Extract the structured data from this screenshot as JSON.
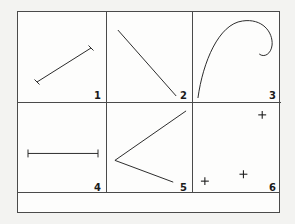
{
  "figure": {
    "background_color": "#f3f3f1",
    "plate_color": "#fdfdfc",
    "border_color": "#4a4a4a",
    "ink_color": "#2b2b2b",
    "caption": "",
    "grid": {
      "columns": 3,
      "rows": 2
    },
    "panels": [
      {
        "number": "1",
        "content": "line-segment-with-end-ticks",
        "description": "diagonal straight line rising left to right with short tick caps at both ends"
      },
      {
        "number": "2",
        "content": "long-diagonal-line",
        "description": "straight line descending from upper left to lower right corner"
      },
      {
        "number": "3",
        "content": "hook-curve",
        "description": "candy-cane style curve rising from lower left, arcing over the top and curling down at right"
      },
      {
        "number": "4",
        "content": "horizontal-bar-with-end-ticks",
        "description": "horizontal straight line with short vertical tick caps at both ends"
      },
      {
        "number": "5",
        "content": "chevron-open-right",
        "description": "two straight segments meeting at a left-pointing vertex, like a less-than sign"
      },
      {
        "number": "6",
        "content": "plus-markers",
        "description": "three small plus-shaped point markers scattered in the panel",
        "markers": [
          {
            "x": 70,
            "y": 12
          },
          {
            "x": 51,
            "y": 72
          },
          {
            "x": 12,
            "y": 79
          }
        ]
      }
    ]
  }
}
